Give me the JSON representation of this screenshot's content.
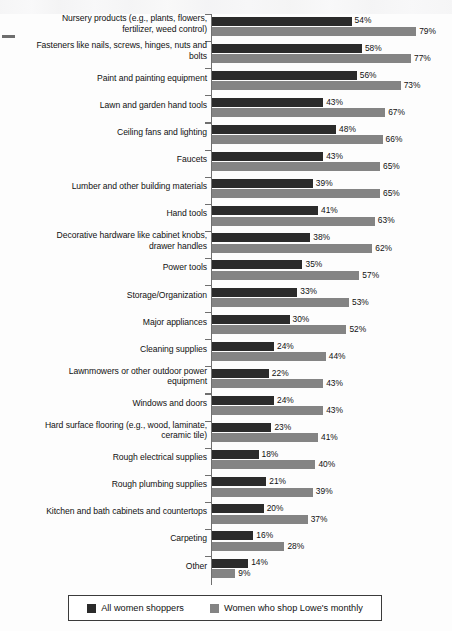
{
  "chart_data": {
    "type": "bar",
    "orientation": "horizontal",
    "title": "",
    "subtitle": "",
    "xlabel": "",
    "ylabel": "",
    "xlim": [
      0,
      80
    ],
    "grid": false,
    "legend_position": "bottom",
    "value_suffix": "%",
    "categories": [
      "Nursery products (e.g., plants, flowers, fertilizer, weed control)",
      "Fasteners like nails, screws, hinges, nuts and bolts",
      "Paint and painting equipment",
      "Lawn and garden hand tools",
      "Ceiling fans and lighting",
      "Faucets",
      "Lumber and other building materials",
      "Hand tools",
      "Decorative hardware like cabinet knobs, drawer handles",
      "Power tools",
      "Storage/Organization",
      "Major appliances",
      "Cleaning supplies",
      "Lawnmowers or other outdoor power equipment",
      "Windows and doors",
      "Hard surface flooring (e.g., wood, laminate, ceramic tile)",
      "Rough electrical supplies",
      "Rough plumbing supplies",
      "Kitchen and bath cabinets and countertops",
      "Carpeting",
      "Other"
    ],
    "category_lines": [
      [
        "Nursery products (e.g., plants, flowers,",
        "fertilizer, weed control)"
      ],
      [
        "Fasteners like nails, screws, hinges, nuts and",
        "bolts"
      ],
      [
        "Paint and painting equipment"
      ],
      [
        "Lawn and garden hand tools"
      ],
      [
        "Ceiling fans and lighting"
      ],
      [
        "Faucets"
      ],
      [
        "Lumber and other building materials"
      ],
      [
        "Hand tools"
      ],
      [
        "Decorative hardware like cabinet knobs,",
        "drawer handles"
      ],
      [
        "Power tools"
      ],
      [
        "Storage/Organization"
      ],
      [
        "Major appliances"
      ],
      [
        "Cleaning supplies"
      ],
      [
        "Lawnmowers or other outdoor power",
        "equipment"
      ],
      [
        "Windows and doors"
      ],
      [
        "Hard surface flooring (e.g., wood, laminate,",
        "ceramic tile)"
      ],
      [
        "Rough electrical supplies"
      ],
      [
        "Rough plumbing supplies"
      ],
      [
        "Kitchen and bath cabinets and countertops"
      ],
      [
        "Carpeting"
      ],
      [
        "Other"
      ]
    ],
    "series": [
      {
        "name": "All women shoppers",
        "color": "#2b2b2b",
        "values": [
          54,
          58,
          56,
          43,
          48,
          43,
          39,
          41,
          38,
          35,
          33,
          30,
          24,
          22,
          24,
          23,
          18,
          21,
          20,
          16,
          14
        ],
        "labels": [
          "54%",
          "58%",
          "56%",
          "43%",
          "48%",
          "43%",
          "39%",
          "41%",
          "38%",
          "35%",
          "33%",
          "30%",
          "24%",
          "22%",
          "24%",
          "23%",
          "18%",
          "21%",
          "20%",
          "16%",
          "14%"
        ]
      },
      {
        "name": "Women who shop Lowe's monthly",
        "color": "#848484",
        "values": [
          79,
          77,
          73,
          67,
          66,
          65,
          65,
          63,
          62,
          57,
          53,
          52,
          44,
          43,
          43,
          41,
          40,
          39,
          37,
          28,
          9
        ],
        "labels": [
          "79%",
          "77%",
          "73%",
          "67%",
          "66%",
          "65%",
          "65%",
          "63%",
          "62%",
          "57%",
          "53%",
          "52%",
          "44%",
          "43%",
          "43%",
          "41%",
          "40%",
          "39%",
          "37%",
          "28%",
          "9%"
        ]
      }
    ]
  },
  "legend": {
    "entries": [
      {
        "label": "All women shoppers",
        "color": "#2b2b2b"
      },
      {
        "label": "Women who shop Lowe's monthly",
        "color": "#848484"
      }
    ]
  },
  "colors": {
    "series_dark": "#2b2b2b",
    "series_gray": "#848484",
    "axis": "#6f6f6f",
    "text": "#111111",
    "background": "#fdfdfd"
  }
}
